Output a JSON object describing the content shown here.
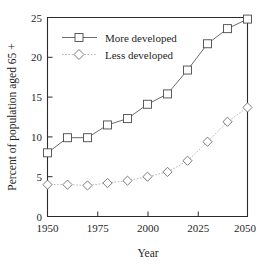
{
  "chart_data": {
    "type": "line",
    "title": "",
    "xlabel": "Year",
    "ylabel": "Percent of population aged 65 +",
    "xlim": [
      1950,
      2050
    ],
    "ylim": [
      0,
      25
    ],
    "grid": false,
    "legend_position": "top-left",
    "xticks": [
      1950,
      1975,
      2000,
      2025,
      2050
    ],
    "xtick_labels": [
      "1950",
      "1975",
      "2000",
      "2025",
      "2050"
    ],
    "yticks": [
      0,
      5,
      10,
      15,
      20,
      25
    ],
    "ytick_labels": [
      "0",
      "5",
      "10",
      "15",
      "20",
      "25"
    ],
    "x": [
      1950,
      1960,
      1970,
      1980,
      1990,
      2000,
      2010,
      2020,
      2030,
      2040,
      2050
    ],
    "series": [
      {
        "name": "More developed",
        "marker": "square",
        "linestyle": "solid",
        "color": "#5a5a5a",
        "values": [
          8.0,
          9.9,
          9.9,
          11.5,
          12.3,
          14.1,
          15.4,
          18.4,
          21.7,
          23.6,
          24.8
        ]
      },
      {
        "name": "Less developed",
        "marker": "diamond",
        "linestyle": "dotted",
        "color": "#b0b0b0",
        "values": [
          4.0,
          4.0,
          3.9,
          4.2,
          4.5,
          5.0,
          5.6,
          7.0,
          9.4,
          11.9,
          13.7
        ]
      }
    ]
  },
  "axis": {
    "y_title": "Percent of population aged 65 +",
    "x_title": "Year"
  },
  "legend": {
    "entries": [
      {
        "label": "More developed"
      },
      {
        "label": "Less developed"
      }
    ]
  }
}
